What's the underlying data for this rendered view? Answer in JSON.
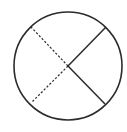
{
  "diagram": {
    "type": "circle-with-diameters",
    "background": "#ffffff",
    "stroke_color": "#2b2b2b",
    "circle": {
      "cx": 68,
      "cy": 66,
      "r": 54,
      "stroke_width": 1.6
    },
    "segments": [
      {
        "name": "upper-right-radius",
        "x1": 68,
        "y1": 66,
        "x2": 106,
        "y2": 27,
        "style": "solid"
      },
      {
        "name": "lower-right-radius",
        "x1": 68,
        "y1": 66,
        "x2": 105,
        "y2": 104,
        "style": "solid"
      },
      {
        "name": "upper-left-radius",
        "x1": 68,
        "y1": 66,
        "x2": 31,
        "y2": 27,
        "style": "dashed"
      },
      {
        "name": "lower-left-radius",
        "x1": 68,
        "y1": 66,
        "x2": 32,
        "y2": 102,
        "style": "dashed"
      }
    ]
  }
}
